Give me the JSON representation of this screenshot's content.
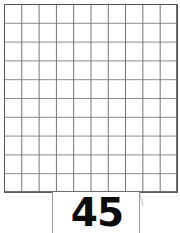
{
  "canvas": {
    "width": 180,
    "height": 233,
    "background_color": "#ffffff"
  },
  "grid": {
    "name": "square grid worksheet",
    "columns": 10,
    "rows": 10,
    "cell_width_px": 17.3,
    "cell_height_px": 18.8,
    "line_color": "#6e6e6e",
    "frame_color": "#555555",
    "fill_color": "#ffffff"
  },
  "callout": {
    "shape": "semicircle",
    "value": "45",
    "text_color": "#0c0c0c",
    "outline_color": "#9a9a9a",
    "fill_color": "#ffffff"
  },
  "chart_data": {
    "type": "table",
    "title": "",
    "xlabel": "",
    "ylabel": "",
    "categories": [],
    "values": [],
    "annotations": [
      {
        "label": "45",
        "position": "bottom-center",
        "description": "number shown inside semicircular label beneath the 10 by 10 square grid"
      }
    ],
    "grid": true,
    "legend": "none"
  }
}
